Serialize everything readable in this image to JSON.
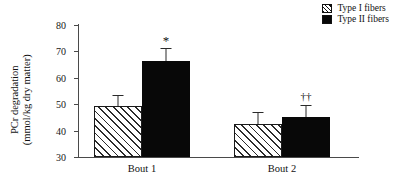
{
  "chart_data": {
    "type": "bar",
    "title": "",
    "xlabel": "",
    "ylabel": "PCr degradation (mmol/kg dry matter)",
    "ylabel_line1": "PCr degradation",
    "ylabel_line2": "(mmol/kg dry matter)",
    "categories": [
      "Bout 1",
      "Bout 2"
    ],
    "ylim": [
      30,
      80
    ],
    "yticks": [
      30,
      40,
      50,
      60,
      70,
      80
    ],
    "grid": false,
    "legend_position": "top-right",
    "series": [
      {
        "name": "Type I fibers",
        "swatch": "hatched",
        "color": "#ffffff",
        "values": [
          49.2,
          42.6
        ],
        "errors": [
          4.3,
          4.6
        ]
      },
      {
        "name": "Type II fibers",
        "swatch": "solid",
        "color": "#080808",
        "values": [
          66.2,
          45.0
        ],
        "errors": [
          5.2,
          4.6
        ]
      }
    ],
    "annotations": [
      {
        "text": "*",
        "category": "Bout 1",
        "series": "Type II fibers",
        "value": 76.5
      },
      {
        "text": "††",
        "category": "Bout 2",
        "series": "Type II fibers",
        "value": 55.0
      }
    ]
  },
  "legend": {
    "items": [
      {
        "label": "Type I fibers"
      },
      {
        "label": "Type II fibers"
      }
    ]
  },
  "axis": {
    "tick_labels": [
      "80",
      "70",
      "60",
      "50",
      "40",
      "30"
    ]
  }
}
